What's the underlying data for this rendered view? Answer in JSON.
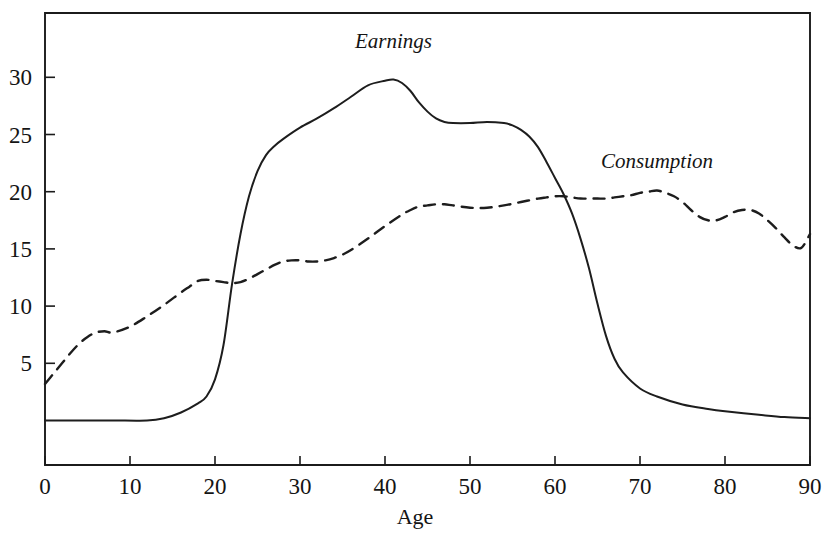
{
  "chart_data": {
    "type": "line",
    "title": "",
    "subtitle": "",
    "xlabel": "Age",
    "ylabel": "",
    "xlim": [
      0,
      90
    ],
    "ylim": [
      0,
      34
    ],
    "grid": false,
    "legend_position": "inline-annotation",
    "xticks": [
      0,
      10,
      20,
      30,
      40,
      50,
      60,
      70,
      80,
      90
    ],
    "xtick_labels": [
      "0",
      "10",
      "20",
      "30",
      "40",
      "50",
      "60",
      "70",
      "80",
      "90"
    ],
    "yticks": [
      5,
      10,
      15,
      20,
      25,
      30
    ],
    "ytick_labels": [
      "5",
      "10",
      "15",
      "20",
      "25",
      "30"
    ],
    "annotations": [
      {
        "text": "Earnings",
        "x": 41,
        "y": 32.6
      },
      {
        "text": "Consumption",
        "x": 72,
        "y": 22.1
      }
    ],
    "series": [
      {
        "name": "Earnings",
        "style": "solid",
        "color": "#1d1d1d",
        "x": [
          0,
          4,
          8,
          12,
          14,
          16,
          18,
          19,
          20,
          21,
          22,
          23,
          24,
          25,
          26,
          27,
          28,
          30,
          32,
          34,
          36,
          38,
          40,
          41,
          42,
          43,
          44,
          45,
          46,
          47,
          48,
          50,
          52,
          54,
          55,
          56,
          57,
          58,
          59,
          60,
          61,
          62,
          63,
          64,
          65,
          66,
          67,
          68,
          70,
          72,
          75,
          78,
          80,
          84,
          87,
          90
        ],
        "y": [
          0,
          0,
          0,
          0,
          0.2,
          0.7,
          1.5,
          2.1,
          3.6,
          6.6,
          11.9,
          16.3,
          19.6,
          21.8,
          23.2,
          24.0,
          24.6,
          25.6,
          26.4,
          27.3,
          28.3,
          29.3,
          29.7,
          29.8,
          29.5,
          28.8,
          27.8,
          27.0,
          26.4,
          26.1,
          26.0,
          26.0,
          26.1,
          26.0,
          25.8,
          25.4,
          24.8,
          23.9,
          22.6,
          21.2,
          19.8,
          18.1,
          15.9,
          13.3,
          10.2,
          7.4,
          5.4,
          4.2,
          2.8,
          2.1,
          1.4,
          1.0,
          0.8,
          0.5,
          0.3,
          0.2
        ]
      },
      {
        "name": "Consumption",
        "style": "dashed",
        "color": "#1d1d1d",
        "x": [
          0,
          1,
          2,
          3,
          4,
          5,
          6,
          7,
          8,
          10,
          12,
          14,
          16,
          17,
          18,
          19,
          20,
          21,
          22,
          23,
          24,
          25,
          26,
          27,
          28,
          29,
          30,
          31,
          32,
          33,
          34,
          35,
          36,
          38,
          40,
          42,
          43,
          44,
          45,
          46,
          47,
          48,
          50,
          52,
          54,
          56,
          58,
          59,
          60,
          61,
          62,
          63,
          64,
          65,
          66,
          67,
          68,
          69,
          70,
          71,
          72,
          73,
          74,
          75,
          76,
          77,
          78,
          79,
          80,
          81,
          82,
          83,
          84,
          85,
          86,
          87,
          88,
          89,
          90
        ],
        "y": [
          3.2,
          4.1,
          5.0,
          5.9,
          6.7,
          7.3,
          7.7,
          7.8,
          7.7,
          8.2,
          9.1,
          10.1,
          11.2,
          11.7,
          12.2,
          12.3,
          12.2,
          12.1,
          12.0,
          12.1,
          12.4,
          12.8,
          13.2,
          13.6,
          13.9,
          14.0,
          14.0,
          13.9,
          13.9,
          14.0,
          14.2,
          14.5,
          14.9,
          15.9,
          17.0,
          18.0,
          18.4,
          18.7,
          18.8,
          18.9,
          18.9,
          18.8,
          18.6,
          18.6,
          18.8,
          19.1,
          19.4,
          19.5,
          19.6,
          19.6,
          19.5,
          19.4,
          19.4,
          19.4,
          19.4,
          19.5,
          19.6,
          19.7,
          19.9,
          20.0,
          20.1,
          19.9,
          19.6,
          19.1,
          18.4,
          17.8,
          17.5,
          17.5,
          17.8,
          18.2,
          18.4,
          18.4,
          18.1,
          17.5,
          16.8,
          16.0,
          15.3,
          15.1,
          16.3
        ]
      }
    ]
  }
}
